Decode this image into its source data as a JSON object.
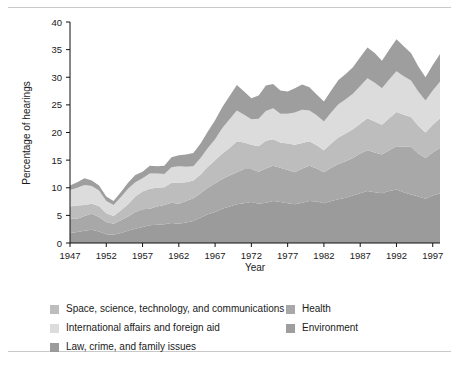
{
  "chart_data": {
    "type": "area",
    "stacked": true,
    "title": "",
    "xlabel": "Year",
    "ylabel": "Percentage of hearings",
    "xlim": [
      1947,
      1998
    ],
    "ylim": [
      0,
      40
    ],
    "ytick_labels": [
      "0",
      "5",
      "10",
      "15",
      "20",
      "25",
      "30",
      "35",
      "40"
    ],
    "ytick_values": [
      0,
      5,
      10,
      15,
      20,
      25,
      30,
      35,
      40
    ],
    "xtick_labels": [
      "1947",
      "1952",
      "1957",
      "1962",
      "1967",
      "1972",
      "1977",
      "1982",
      "1987",
      "1992",
      "1997"
    ],
    "xtick_values": [
      1947,
      1952,
      1957,
      1962,
      1967,
      1972,
      1977,
      1982,
      1987,
      1992,
      1997
    ],
    "grid": false,
    "legend_position": "bottom",
    "x": [
      1947,
      1948,
      1949,
      1950,
      1951,
      1952,
      1953,
      1954,
      1955,
      1956,
      1957,
      1958,
      1959,
      1960,
      1961,
      1962,
      1963,
      1964,
      1965,
      1966,
      1967,
      1968,
      1969,
      1970,
      1971,
      1972,
      1973,
      1974,
      1975,
      1976,
      1977,
      1978,
      1979,
      1980,
      1981,
      1982,
      1983,
      1984,
      1985,
      1986,
      1987,
      1988,
      1989,
      1990,
      1991,
      1992,
      1993,
      1994,
      1995,
      1996,
      1997,
      1998
    ],
    "series": [
      {
        "name": "Law, crime, and family issues",
        "color": "#9b9b9b",
        "values": [
          1.8,
          2.0,
          2.2,
          2.4,
          2.1,
          1.6,
          1.5,
          1.8,
          2.2,
          2.6,
          2.9,
          3.2,
          3.3,
          3.4,
          3.6,
          3.5,
          3.7,
          4.0,
          4.6,
          5.2,
          5.6,
          6.2,
          6.6,
          7.0,
          7.2,
          7.4,
          7.1,
          7.3,
          7.6,
          7.4,
          7.2,
          7.0,
          7.3,
          7.6,
          7.5,
          7.2,
          7.6,
          7.9,
          8.2,
          8.6,
          9.0,
          9.4,
          9.2,
          9.0,
          9.4,
          9.7,
          9.2,
          8.8,
          8.4,
          8.0,
          8.6,
          9.0
        ]
      },
      {
        "name": "Health",
        "color": "#a8a8a8",
        "values": [
          2.6,
          2.4,
          2.7,
          2.9,
          2.6,
          2.2,
          2.0,
          2.3,
          2.6,
          3.0,
          3.2,
          3.0,
          3.3,
          3.5,
          3.7,
          3.6,
          3.9,
          4.1,
          4.4,
          4.8,
          5.2,
          5.4,
          5.6,
          5.8,
          6.2,
          6.0,
          5.8,
          6.2,
          6.4,
          6.2,
          6.0,
          5.8,
          6.2,
          6.4,
          6.0,
          5.6,
          6.0,
          6.4,
          6.6,
          6.8,
          7.2,
          7.4,
          7.2,
          7.0,
          7.4,
          7.8,
          8.2,
          8.6,
          7.8,
          7.4,
          7.8,
          8.2
        ]
      },
      {
        "name": "Space, science, technology, and communications",
        "color": "#bdbdbd",
        "values": [
          2.2,
          2.4,
          2.0,
          1.8,
          2.0,
          1.6,
          1.4,
          1.8,
          2.2,
          2.8,
          3.2,
          3.6,
          3.4,
          3.2,
          3.6,
          3.8,
          3.4,
          3.2,
          3.4,
          3.8,
          4.2,
          4.6,
          5.0,
          5.6,
          4.8,
          4.4,
          4.6,
          5.0,
          4.8,
          4.6,
          4.8,
          5.0,
          4.6,
          4.4,
          4.2,
          4.0,
          4.4,
          4.8,
          5.0,
          5.2,
          5.4,
          5.8,
          5.6,
          5.4,
          5.8,
          6.2,
          5.8,
          5.4,
          5.0,
          4.6,
          5.0,
          5.4
        ]
      },
      {
        "name": "International affairs and foreign aid",
        "color": "#dcdcdc",
        "values": [
          3.0,
          3.2,
          3.6,
          3.2,
          2.8,
          2.2,
          2.0,
          2.4,
          2.8,
          2.6,
          2.4,
          2.8,
          2.6,
          2.4,
          2.8,
          3.0,
          2.8,
          2.6,
          3.0,
          3.4,
          3.8,
          4.6,
          5.2,
          5.6,
          5.0,
          4.6,
          5.0,
          5.4,
          5.6,
          5.2,
          5.4,
          5.8,
          6.0,
          5.6,
          5.4,
          5.2,
          5.6,
          6.0,
          6.2,
          6.4,
          6.8,
          7.2,
          7.0,
          6.6,
          7.0,
          7.4,
          7.0,
          6.6,
          6.2,
          5.8,
          6.2,
          6.6
        ]
      },
      {
        "name": "Environment",
        "color": "#9e9e9e",
        "values": [
          0.8,
          1.0,
          1.2,
          1.0,
          0.9,
          0.8,
          0.7,
          0.9,
          1.1,
          1.3,
          1.2,
          1.4,
          1.3,
          1.5,
          1.8,
          2.0,
          2.2,
          2.4,
          2.6,
          3.0,
          3.4,
          3.8,
          4.2,
          4.6,
          4.2,
          3.8,
          4.2,
          4.6,
          4.4,
          4.2,
          4.0,
          4.4,
          4.6,
          4.2,
          3.8,
          3.6,
          4.0,
          4.4,
          4.6,
          4.8,
          5.2,
          5.6,
          5.4,
          5.0,
          5.4,
          5.8,
          5.4,
          5.0,
          4.6,
          4.2,
          4.6,
          5.0
        ]
      }
    ],
    "legend_order": [
      "Space, science, technology, and communications",
      "Health",
      "International affairs and foreign aid",
      "Environment",
      "Law, crime, and family issues"
    ]
  }
}
